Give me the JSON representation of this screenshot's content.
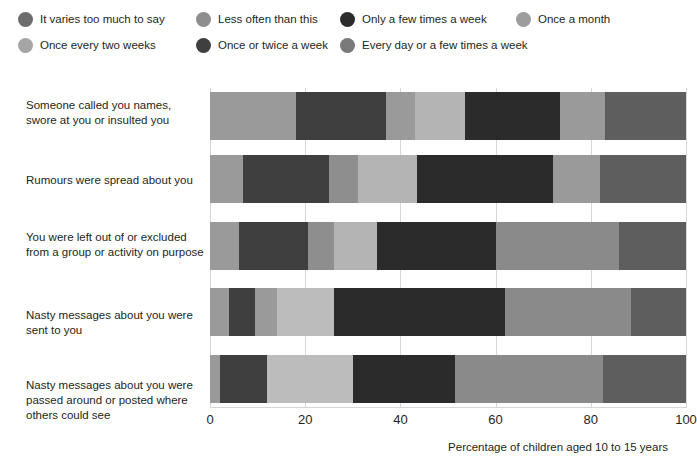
{
  "top_cut_text": "",
  "legend": {
    "items": [
      {
        "label": "It varies too much to say",
        "color": "#6d6d6d",
        "x": 18,
        "y": 0
      },
      {
        "label": "Less often than this",
        "color": "#8e8e8e",
        "x": 196,
        "y": 0
      },
      {
        "label": "Only a few times a week",
        "color": "#2b2b2b",
        "x": 340,
        "y": 0
      },
      {
        "label": "Once a month",
        "color": "#9d9d9d",
        "x": 516,
        "y": 0
      },
      {
        "label": "Once every two weeks",
        "color": "#a5a5a5",
        "x": 18,
        "y": 26
      },
      {
        "label": "Once or twice a week",
        "color": "#3f3f3f",
        "x": 196,
        "y": 26
      },
      {
        "label": "Every day or a few times a week",
        "color": "#7a7a7a",
        "x": 340,
        "y": 26
      }
    ]
  },
  "chart_data": {
    "type": "bar",
    "orientation": "horizontal",
    "stacked": true,
    "stack_total": 100,
    "title": "",
    "xlabel": "Percentage of children aged 10 to 15 years",
    "ylabel": "",
    "xlim": [
      0,
      100
    ],
    "xticks": [
      0,
      20,
      40,
      60,
      80,
      100
    ],
    "xtick_labels": [
      "0",
      "20",
      "40",
      "60",
      "80",
      "100"
    ],
    "grid": "vertical",
    "legend_position": "top",
    "categories": [
      "Someone called you names, swore at you or insulted you",
      "Rumours were spread about you",
      "You were left out of or excluded from a group or activity on purpose",
      "Nasty messages about you were sent to you",
      "Nasty messages about you were passed around or posted where others could see"
    ],
    "series": [
      {
        "name": "It varies too much to say",
        "color": "#6d6d6d",
        "values": [
          18.0,
          7.0,
          6.0,
          4.0,
          2.0
        ]
      },
      {
        "name": "Once a month",
        "color": "#9d9d9d",
        "values": [
          0.0,
          0.0,
          0.0,
          0.0,
          0.0
        ]
      },
      {
        "name": "Once or twice a week",
        "color": "#3f3f3f",
        "values": [
          19.0,
          18.0,
          14.5,
          5.5,
          10.0
        ]
      },
      {
        "name": "Less often than this",
        "color": "#8e8e8e",
        "values": [
          6.0,
          6.0,
          5.5,
          4.5,
          0.0
        ]
      },
      {
        "name": "Once every two weeks",
        "color": "#b0b0b0",
        "values": [
          10.5,
          12.5,
          9.0,
          12.0,
          18.0
        ]
      },
      {
        "name": "Only a few times a week",
        "color": "#2b2b2b",
        "values": [
          20.0,
          28.5,
          25.0,
          36.0,
          21.5
        ]
      },
      {
        "name": "Every day or a few times a week",
        "color": "#8a8a8a",
        "values": [
          9.5,
          10.0,
          26.0,
          26.5,
          31.0
        ]
      },
      {
        "name": "Final dark",
        "color": "#5e5e5e",
        "values": [
          17.0,
          18.0,
          14.0,
          11.5,
          17.5
        ]
      }
    ],
    "bars": [
      {
        "category_index": 0,
        "segments": [
          {
            "series": "It varies too much to say",
            "value": 18.0,
            "start": 0.0,
            "color": "#9a9a9a"
          },
          {
            "series": "Once or twice a week",
            "value": 19.0,
            "start": 18.0,
            "color": "#3f3f3f"
          },
          {
            "series": "Less often than this",
            "value": 6.0,
            "start": 37.0,
            "color": "#9a9a9a"
          },
          {
            "series": "Once every two weeks",
            "value": 10.5,
            "start": 43.0,
            "color": "#b4b4b4"
          },
          {
            "series": "Only a few times a week",
            "value": 20.0,
            "start": 53.5,
            "color": "#2b2b2b"
          },
          {
            "series": "Every day or a few times a week",
            "value": 9.5,
            "start": 73.5,
            "color": "#9a9a9a"
          },
          {
            "series": "Final dark",
            "value": 17.0,
            "start": 83.0,
            "color": "#5e5e5e"
          }
        ]
      },
      {
        "category_index": 1,
        "segments": [
          {
            "series": "It varies too much to say",
            "value": 7.0,
            "start": 0.0,
            "color": "#9a9a9a"
          },
          {
            "series": "Once or twice a week",
            "value": 18.0,
            "start": 7.0,
            "color": "#3f3f3f"
          },
          {
            "series": "Less often than this",
            "value": 6.0,
            "start": 25.0,
            "color": "#8e8e8e"
          },
          {
            "series": "Once every two weeks",
            "value": 12.5,
            "start": 31.0,
            "color": "#b4b4b4"
          },
          {
            "series": "Only a few times a week",
            "value": 28.5,
            "start": 43.5,
            "color": "#2b2b2b"
          },
          {
            "series": "Every day or a few times a week",
            "value": 10.0,
            "start": 72.0,
            "color": "#9a9a9a"
          },
          {
            "series": "Final dark",
            "value": 18.0,
            "start": 82.0,
            "color": "#5e5e5e"
          }
        ]
      },
      {
        "category_index": 2,
        "segments": [
          {
            "series": "It varies too much to say",
            "value": 6.0,
            "start": 0.0,
            "color": "#9a9a9a"
          },
          {
            "series": "Once or twice a week",
            "value": 14.5,
            "start": 6.0,
            "color": "#3f3f3f"
          },
          {
            "series": "Less often than this",
            "value": 5.5,
            "start": 20.5,
            "color": "#8e8e8e"
          },
          {
            "series": "Once every two weeks",
            "value": 9.0,
            "start": 26.0,
            "color": "#b4b4b4"
          },
          {
            "series": "Only a few times a week",
            "value": 25.0,
            "start": 35.0,
            "color": "#2b2b2b"
          },
          {
            "series": "Every day or a few times a week",
            "value": 26.0,
            "start": 60.0,
            "color": "#8a8a8a"
          },
          {
            "series": "Final dark",
            "value": 14.0,
            "start": 86.0,
            "color": "#5e5e5e"
          }
        ]
      },
      {
        "category_index": 3,
        "segments": [
          {
            "series": "It varies too much to say",
            "value": 4.0,
            "start": 0.0,
            "color": "#9a9a9a"
          },
          {
            "series": "Once or twice a week",
            "value": 5.5,
            "start": 4.0,
            "color": "#3f3f3f"
          },
          {
            "series": "Less often than this",
            "value": 4.5,
            "start": 9.5,
            "color": "#9a9a9a"
          },
          {
            "series": "Once every two weeks",
            "value": 12.0,
            "start": 14.0,
            "color": "#bcbcbc"
          },
          {
            "series": "Only a few times a week",
            "value": 36.0,
            "start": 26.0,
            "color": "#2b2b2b"
          },
          {
            "series": "Every day or a few times a week",
            "value": 26.5,
            "start": 62.0,
            "color": "#8a8a8a"
          },
          {
            "series": "Final dark",
            "value": 11.5,
            "start": 88.5,
            "color": "#5e5e5e"
          }
        ]
      },
      {
        "category_index": 4,
        "segments": [
          {
            "series": "It varies too much to say",
            "value": 2.0,
            "start": 0.0,
            "color": "#9a9a9a"
          },
          {
            "series": "Once or twice a week",
            "value": 10.0,
            "start": 2.0,
            "color": "#3f3f3f"
          },
          {
            "series": "Once every two weeks",
            "value": 18.0,
            "start": 12.0,
            "color": "#bcbcbc"
          },
          {
            "series": "Only a few times a week",
            "value": 21.5,
            "start": 30.0,
            "color": "#2b2b2b"
          },
          {
            "series": "Every day or a few times a week",
            "value": 31.0,
            "start": 51.5,
            "color": "#8a8a8a"
          },
          {
            "series": "Final dark",
            "value": 17.5,
            "start": 82.5,
            "color": "#5e5e5e"
          }
        ]
      }
    ]
  },
  "layout": {
    "bar_tops": [
      4,
      67,
      134,
      200,
      267
    ],
    "bar_height": 48,
    "label_tops": [
      10,
      85,
      142,
      220,
      290
    ]
  }
}
